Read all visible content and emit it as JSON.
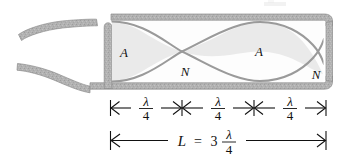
{
  "figure": {
    "colors": {
      "wall": "#b0b0b0",
      "wall_edge": "#8d8d8d",
      "wave_curve": "#9a9a9a",
      "lobe_fill": "#eaeaea",
      "bore": "#fdfdfd",
      "ink": "#111111",
      "background": "#ffffff"
    },
    "wave_labels": [
      {
        "id": "antinode-left",
        "text": "A",
        "meaning": "antinode"
      },
      {
        "id": "node-middle",
        "text": "N",
        "meaning": "node"
      },
      {
        "id": "antinode-right",
        "text": "A",
        "meaning": "antinode"
      },
      {
        "id": "node-right",
        "text": "N",
        "meaning": "node"
      }
    ],
    "segments": [
      {
        "id": "segment-1",
        "numerator": "λ",
        "denominator": "4"
      },
      {
        "id": "segment-2",
        "numerator": "λ",
        "denominator": "4"
      },
      {
        "id": "segment-3",
        "numerator": "λ",
        "denominator": "4"
      }
    ],
    "total_length": {
      "symbol": "L",
      "equals": "=",
      "coefficient": "3",
      "numerator": "λ",
      "denominator": "4"
    }
  }
}
